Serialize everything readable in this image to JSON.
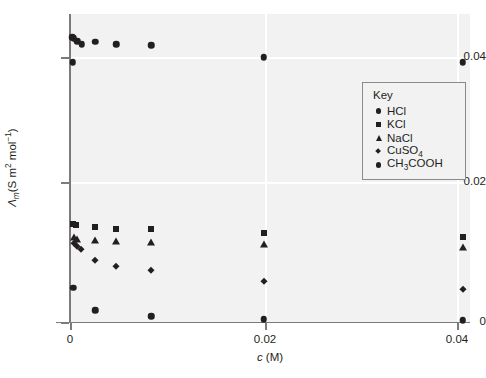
{
  "chart_data": {
    "type": "scatter",
    "title": "",
    "xlabel": "c (M)",
    "ylabel": "Λm(S m2 mol-1)",
    "xlabel_parts": {
      "italic": "c",
      "rest": " (M)"
    },
    "ylabel_parts": {
      "symbol": "Λ",
      "subscript": "m",
      "open": "(S m",
      "sup1": "2",
      "mid": " mol",
      "sup2": "−1",
      "close": ")"
    },
    "xlim": [
      0,
      0.0415
    ],
    "ylim": [
      0,
      0.0455
    ],
    "xticks": [
      0,
      0.02,
      0.04
    ],
    "xticklabels": [
      "0",
      "0.02",
      "0.04"
    ],
    "yticks": [
      0,
      0.02,
      0.04
    ],
    "yticklabels": [
      "0",
      "0.02",
      "0.04"
    ],
    "grid": true,
    "legend_position": "right-upper-inside",
    "legend_title": "Key",
    "series": [
      {
        "name": "HCl",
        "marker": "circle",
        "points": [
          [
            0.00022,
            0.043
          ],
          [
            0.0004,
            0.0428
          ],
          [
            0.00075,
            0.0424
          ],
          [
            0.0012,
            0.0419
          ],
          [
            0.0026,
            0.0423
          ],
          [
            0.0048,
            0.0419
          ],
          [
            0.0084,
            0.0418
          ],
          [
            0.02,
            0.04
          ],
          [
            0.0406,
            0.0392
          ]
        ]
      },
      {
        "name": "KCl",
        "marker": "square",
        "points": [
          [
            0.0003,
            0.0148
          ],
          [
            0.0006,
            0.0146
          ],
          [
            0.0026,
            0.0143
          ],
          [
            0.0048,
            0.0141
          ],
          [
            0.0084,
            0.014
          ],
          [
            0.02,
            0.0134
          ],
          [
            0.0406,
            0.0129
          ]
        ]
      },
      {
        "name": "NaCl",
        "marker": "triangle",
        "points": [
          [
            0.0004,
            0.0128
          ],
          [
            0.0007,
            0.0126
          ],
          [
            0.0026,
            0.0124
          ],
          [
            0.0048,
            0.0122
          ],
          [
            0.0084,
            0.0121
          ],
          [
            0.02,
            0.0117
          ],
          [
            0.0406,
            0.0113
          ]
        ]
      },
      {
        "name": "CuSO4",
        "marker": "diamond",
        "points": [
          [
            0.0004,
            0.012
          ],
          [
            0.00075,
            0.0114
          ],
          [
            0.0011,
            0.011
          ],
          [
            0.0026,
            0.0094
          ],
          [
            0.0048,
            0.0085
          ],
          [
            0.0084,
            0.0078
          ],
          [
            0.02,
            0.0062
          ],
          [
            0.0406,
            0.005
          ]
        ]
      },
      {
        "name": "CH3COOH",
        "marker": "circle",
        "points": [
          [
            0.0003,
            0.0392
          ],
          [
            0.00035,
            0.0052
          ],
          [
            0.0026,
            0.0018
          ],
          [
            0.0084,
            0.0009
          ],
          [
            0.02,
            0.0004
          ],
          [
            0.0406,
            0.0003
          ]
        ]
      }
    ],
    "legend_entries": [
      {
        "label": "HCl",
        "marker": "circle",
        "label_parts": {
          "text": "HCl"
        }
      },
      {
        "label": "KCl",
        "marker": "square",
        "label_parts": {
          "text": "KCl"
        }
      },
      {
        "label": "NaCl",
        "marker": "triangle",
        "label_parts": {
          "text": "NaCl"
        }
      },
      {
        "label": "CuSO4",
        "marker": "diamond",
        "label_parts": {
          "pre": "CuSO",
          "sub": "4",
          "post": ""
        }
      },
      {
        "label": "CH3COOH",
        "marker": "circle",
        "label_parts": {
          "pre": "CH",
          "sub": "3",
          "post": "COOH"
        }
      }
    ],
    "colors": {
      "marker": "#231f20",
      "plot_background": "#f2f2f2",
      "gridline": "#ffffff",
      "axis": "#7b7b7b",
      "legend_border": "#8a8a8a"
    }
  }
}
